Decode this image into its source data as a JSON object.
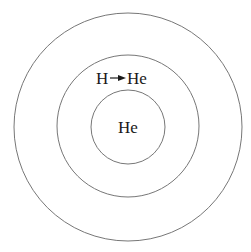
{
  "diagram": {
    "type": "concentric-shells",
    "center": [
      128,
      127
    ],
    "circles": [
      {
        "name": "outer-shell",
        "radius": 114
      },
      {
        "name": "middle-shell",
        "radius": 71
      },
      {
        "name": "inner-core",
        "radius": 37
      }
    ],
    "labels": {
      "shell_reaction_from": "H",
      "shell_reaction_to": "He",
      "core": "He"
    },
    "colors": {
      "stroke": "#777777",
      "text": "#1a1a1a",
      "background": "#ffffff"
    }
  }
}
